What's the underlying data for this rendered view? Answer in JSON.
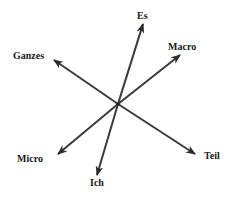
{
  "diagram": {
    "type": "radial-axes",
    "center": {
      "x": 118,
      "y": 104
    },
    "line_color": "#3a3a3a",
    "label_color": "#1a1a1a",
    "axes": [
      {
        "id": "es-ich",
        "ends": [
          {
            "label": "Es",
            "tip": {
              "x": 143,
              "y": 24
            },
            "label_pos": {
              "x": 137,
              "y": 11
            }
          },
          {
            "label": "Ich",
            "tip": {
              "x": 97,
              "y": 175
            },
            "label_pos": {
              "x": 90,
              "y": 178
            }
          }
        ]
      },
      {
        "id": "macro-micro",
        "ends": [
          {
            "label": "Macro",
            "tip": {
              "x": 180,
              "y": 55
            },
            "label_pos": {
              "x": 168,
              "y": 42
            }
          },
          {
            "label": "Micro",
            "tip": {
              "x": 58,
              "y": 154
            },
            "label_pos": {
              "x": 17,
              "y": 154
            }
          }
        ]
      },
      {
        "id": "ganzes-teil",
        "ends": [
          {
            "label": "Ganzes",
            "tip": {
              "x": 54,
              "y": 60
            },
            "label_pos": {
              "x": 13,
              "y": 51
            }
          },
          {
            "label": "Teil",
            "tip": {
              "x": 195,
              "y": 154
            },
            "label_pos": {
              "x": 204,
              "y": 151
            }
          }
        ]
      }
    ]
  }
}
